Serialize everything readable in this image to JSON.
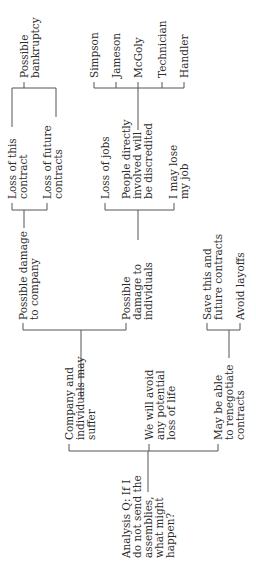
{
  "diagram": {
    "type": "tree",
    "orientation": "rotated-90-ccw",
    "line_color": "#555555",
    "text_color": "#2b2b2b",
    "root": {
      "id": "root",
      "lines": [
        "Analysis Q: If I",
        "do not send the",
        "assemblies,",
        "what might",
        "happen?"
      ]
    },
    "nodes": {
      "company_individuals": {
        "lines": [
          "Company and",
          "individuals may",
          "suffer"
        ]
      },
      "avoid_loss_of_life": {
        "lines": [
          "We will avoid",
          "any potential",
          "loss of life"
        ]
      },
      "renegotiate": {
        "lines": [
          "May be able",
          "to renegotiate",
          "contracts"
        ]
      },
      "damage_company": {
        "lines": [
          "Possible damage",
          "to company"
        ]
      },
      "damage_individuals": {
        "lines": [
          "Possible",
          "damage to",
          "individuals"
        ]
      },
      "loss_this_contract": {
        "lines": [
          "Loss of this",
          "contract"
        ]
      },
      "loss_future_contracts": {
        "lines": [
          "Loss of future",
          "contracts"
        ]
      },
      "bankruptcy": {
        "lines": [
          "Possible",
          "bankruptcy"
        ]
      },
      "loss_of_jobs": {
        "lines": [
          "Loss of jobs"
        ]
      },
      "people_discredited": {
        "lines": [
          "People directly",
          "involved will",
          "be discredited"
        ]
      },
      "lose_my_job": {
        "lines": [
          "I may lose",
          "my job"
        ]
      },
      "simpson": {
        "lines": [
          "Simpson"
        ]
      },
      "jameson": {
        "lines": [
          "Jameson"
        ]
      },
      "mcgoly": {
        "lines": [
          "McGoly"
        ]
      },
      "technician": {
        "lines": [
          "Technician"
        ]
      },
      "handler": {
        "lines": [
          "Handler"
        ]
      },
      "save_contracts": {
        "lines": [
          "Save this and",
          "future contracts"
        ]
      },
      "avoid_layoffs": {
        "lines": [
          "Avoid layoffs"
        ]
      }
    },
    "edges": [
      [
        "root",
        "company_individuals"
      ],
      [
        "root",
        "avoid_loss_of_life"
      ],
      [
        "root",
        "renegotiate"
      ],
      [
        "company_individuals",
        "damage_company"
      ],
      [
        "company_individuals",
        "damage_individuals"
      ],
      [
        "damage_company",
        "loss_this_contract"
      ],
      [
        "damage_company",
        "loss_future_contracts"
      ],
      [
        "loss_this_contract",
        "bankruptcy"
      ],
      [
        "damage_individuals",
        "loss_of_jobs"
      ],
      [
        "damage_individuals",
        "people_discredited"
      ],
      [
        "damage_individuals",
        "lose_my_job"
      ],
      [
        "people_discredited",
        "simpson"
      ],
      [
        "people_discredited",
        "jameson"
      ],
      [
        "people_discredited",
        "mcgoly"
      ],
      [
        "people_discredited",
        "technician"
      ],
      [
        "people_discredited",
        "handler"
      ],
      [
        "renegotiate",
        "save_contracts"
      ],
      [
        "renegotiate",
        "avoid_layoffs"
      ]
    ]
  }
}
